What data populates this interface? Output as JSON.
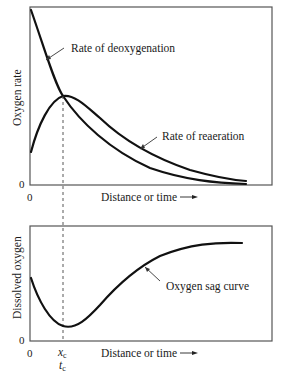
{
  "top_plot": {
    "ylabel": "Oxygen rate",
    "xlabel": "Distance or time",
    "arrow_glyph": "→",
    "y_origin_label": "0",
    "x_origin_label": "0",
    "curve_labels": {
      "deoxygenation": "Rate of deoxygenation",
      "reaeration": "Rate of reaeration"
    }
  },
  "bottom_plot": {
    "ylabel": "Dissolved oxygen",
    "xlabel": "Distance or time",
    "arrow_glyph": "→",
    "y_origin_label": "0",
    "x_origin_label": "0",
    "curve_labels": {
      "sag": "Oxygen sag curve"
    },
    "critical_point": {
      "x_label": "x",
      "x_sub": "c",
      "t_label": "t",
      "t_sub": "c"
    }
  },
  "colors": {
    "curve": "#111111",
    "frame": "#555555",
    "background": "#ffffff"
  }
}
